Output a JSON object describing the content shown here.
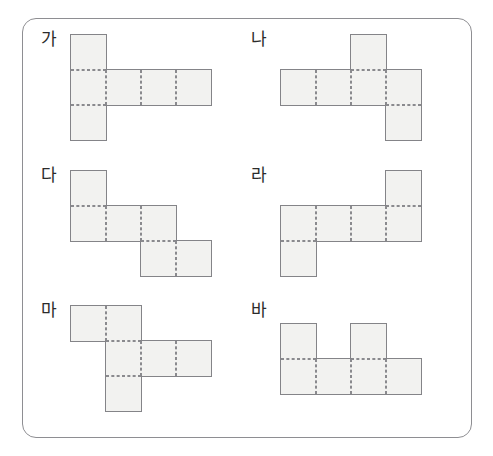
{
  "page": {
    "top_text_sliver": {
      "left_fragment": "––",
      "right_fragment": "–– ·· · · ·"
    }
  },
  "panel": {
    "border_color": "#8e8e92",
    "background": "#ffffff",
    "corner_radius_px": 14
  },
  "style": {
    "cell_fill": "#f2f2f0",
    "cell_outline_color": "#848488",
    "fold_line_color": "#8a8a8e",
    "label_color": "#2b2b2b",
    "cell_size_px": 35
  },
  "nets": [
    {
      "id": "net-ga",
      "label": "가",
      "square_count": 6,
      "grid_columns": 4,
      "grid_rows": 3,
      "cells": [
        {
          "col": 0,
          "row": 0
        },
        {
          "col": 0,
          "row": 1
        },
        {
          "col": 0,
          "row": 2
        },
        {
          "col": 1,
          "row": 1
        },
        {
          "col": 2,
          "row": 1
        },
        {
          "col": 3,
          "row": 1
        }
      ]
    },
    {
      "id": "net-na",
      "label": "나",
      "square_count": 6,
      "grid_columns": 4,
      "grid_rows": 3,
      "cells": [
        {
          "col": 2,
          "row": 0
        },
        {
          "col": 0,
          "row": 1
        },
        {
          "col": 1,
          "row": 1
        },
        {
          "col": 2,
          "row": 1
        },
        {
          "col": 3,
          "row": 1
        },
        {
          "col": 3,
          "row": 2
        }
      ]
    },
    {
      "id": "net-da",
      "label": "다",
      "square_count": 6,
      "grid_columns": 4,
      "grid_rows": 3,
      "cells": [
        {
          "col": 0,
          "row": 0
        },
        {
          "col": 0,
          "row": 1
        },
        {
          "col": 1,
          "row": 1
        },
        {
          "col": 2,
          "row": 1
        },
        {
          "col": 2,
          "row": 2
        },
        {
          "col": 3,
          "row": 2
        }
      ]
    },
    {
      "id": "net-ra",
      "label": "라",
      "square_count": 6,
      "grid_columns": 4,
      "grid_rows": 3,
      "cells": [
        {
          "col": 3,
          "row": 0
        },
        {
          "col": 0,
          "row": 1
        },
        {
          "col": 1,
          "row": 1
        },
        {
          "col": 2,
          "row": 1
        },
        {
          "col": 3,
          "row": 1
        },
        {
          "col": 0,
          "row": 2
        }
      ]
    },
    {
      "id": "net-ma",
      "label": "마",
      "square_count": 6,
      "grid_columns": 4,
      "grid_rows": 3,
      "cells": [
        {
          "col": 0,
          "row": 0
        },
        {
          "col": 1,
          "row": 0
        },
        {
          "col": 1,
          "row": 1
        },
        {
          "col": 2,
          "row": 1
        },
        {
          "col": 3,
          "row": 1
        },
        {
          "col": 1,
          "row": 2
        }
      ]
    },
    {
      "id": "net-ba",
      "label": "바",
      "square_count": 6,
      "grid_columns": 4,
      "grid_rows": 2,
      "cells": [
        {
          "col": 0,
          "row": 0
        },
        {
          "col": 2,
          "row": 0
        },
        {
          "col": 0,
          "row": 1
        },
        {
          "col": 1,
          "row": 1
        },
        {
          "col": 2,
          "row": 1
        },
        {
          "col": 3,
          "row": 1
        }
      ]
    }
  ]
}
